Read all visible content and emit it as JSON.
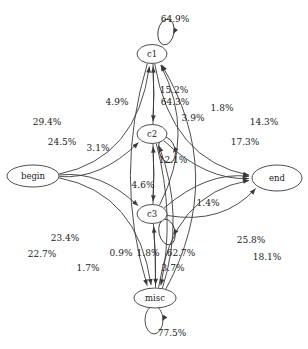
{
  "diagram": {
    "type": "state-transition-graph",
    "title": "",
    "background_color": "#ffffff",
    "stroke_color": "#3a3a3a",
    "text_color": "#1a1a1a",
    "nodes": [
      {
        "id": "begin",
        "label": "begin",
        "cx": 33,
        "cy": 176,
        "rx": 26,
        "ry": 11
      },
      {
        "id": "c1",
        "label": "c1",
        "cx": 152,
        "cy": 54,
        "rx": 15,
        "ry": 9.5
      },
      {
        "id": "c2",
        "label": "c2",
        "cx": 152,
        "cy": 134,
        "rx": 15,
        "ry": 9.5
      },
      {
        "id": "c3",
        "label": "c3",
        "cx": 152,
        "cy": 214,
        "rx": 15,
        "ry": 9.5
      },
      {
        "id": "misc",
        "label": "misc",
        "cx": 155,
        "cy": 298,
        "rx": 21,
        "ry": 10
      },
      {
        "id": "end",
        "label": "end",
        "cx": 277,
        "cy": 178,
        "rx": 25,
        "ry": 13
      }
    ],
    "edges": [
      {
        "from": "c1",
        "to": "c1",
        "label": "64.9%",
        "label_x": 175,
        "label_y": 19
      },
      {
        "from": "c2",
        "to": "c2",
        "label": "64.3%",
        "label_x": 175,
        "label_y": 102
      },
      {
        "from": "c3",
        "to": "c3",
        "label": "62.7%",
        "label_x": 181,
        "label_y": 253
      },
      {
        "from": "misc",
        "to": "misc",
        "label": "77.5%",
        "label_x": 172,
        "label_y": 333
      },
      {
        "from": "c1",
        "to": "c2",
        "label": "15.2%",
        "label_x": 174,
        "label_y": 90
      },
      {
        "from": "c2",
        "to": "c1",
        "label": "4.9%",
        "label_x": 117,
        "label_y": 102
      },
      {
        "from": "c2",
        "to": "c3",
        "label": "12.1%",
        "label_x": 173,
        "label_y": 160
      },
      {
        "from": "c3",
        "to": "c2",
        "label": "4.6%",
        "label_x": 143,
        "label_y": 185
      },
      {
        "from": "c3",
        "to": "misc",
        "label": "3.7%",
        "label_x": 173,
        "label_y": 268
      },
      {
        "from": "misc",
        "to": "c3",
        "label": "1.8%",
        "label_x": 148,
        "label_y": 253
      },
      {
        "from": "begin",
        "to": "c1",
        "label": "29.4%",
        "label_x": 47,
        "label_y": 122
      },
      {
        "from": "begin",
        "to": "c2",
        "label": "24.5%",
        "label_x": 62,
        "label_y": 142
      },
      {
        "from": "begin",
        "to": "c3",
        "label": "23.4%",
        "label_x": 65,
        "label_y": 238
      },
      {
        "from": "begin",
        "to": "misc",
        "label": "22.7%",
        "label_x": 42,
        "label_y": 254
      },
      {
        "from": "c3",
        "to": "c1",
        "label": "3.1%",
        "label_x": 98,
        "label_y": 148
      },
      {
        "from": "misc",
        "to": "c1",
        "label": "1.7%",
        "label_x": 88,
        "label_y": 268
      },
      {
        "from": "misc",
        "to": "c2",
        "label": "0.9%",
        "label_x": 121,
        "label_y": 253
      },
      {
        "from": "c1",
        "to": "end",
        "label": "14.3%",
        "label_x": 264,
        "label_y": 122
      },
      {
        "from": "c1",
        "to": "misc",
        "label": "1.8%",
        "label_x": 222,
        "label_y": 108
      },
      {
        "from": "c2",
        "to": "end",
        "label": "17.3%",
        "label_x": 245,
        "label_y": 142
      },
      {
        "from": "c2",
        "to": "misc",
        "label": "3.9%",
        "label_x": 193,
        "label_y": 118
      },
      {
        "from": "c3",
        "to": "end",
        "label": "25.8%",
        "label_x": 251,
        "label_y": 240
      },
      {
        "from": "c3",
        "to": "end",
        "label": "1.4%",
        "label_x": 208,
        "label_y": 203
      },
      {
        "from": "misc",
        "to": "end",
        "label": "18.1%",
        "label_x": 267,
        "label_y": 257
      }
    ]
  }
}
